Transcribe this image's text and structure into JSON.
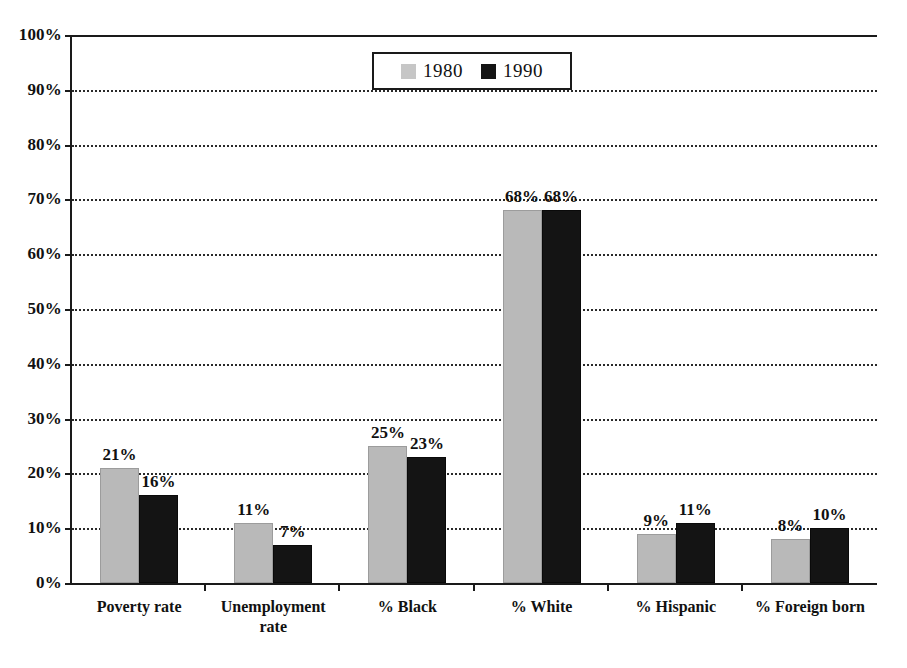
{
  "chart_data": {
    "type": "bar",
    "title": "",
    "subtitle": "",
    "xlabel": "",
    "ylabel": "",
    "grid": true,
    "legend_position": "top-center",
    "ylim": [
      0,
      100
    ],
    "ytick_labels": [
      "100%",
      "90%",
      "80%",
      "70%",
      "60%",
      "50%",
      "40%",
      "30%",
      "20%",
      "10%",
      "0%"
    ],
    "ytick_values": [
      100,
      90,
      80,
      70,
      60,
      50,
      40,
      30,
      20,
      10,
      0
    ],
    "categories": [
      "Poverty rate",
      "Unemployment\nrate",
      "% Black",
      "% White",
      "% Hispanic",
      "% Foreign born"
    ],
    "series": [
      {
        "name": "1980",
        "color": "#b9b9b9",
        "values": [
          21,
          11,
          25,
          68,
          9,
          8
        ],
        "labels": [
          "21%",
          "11%",
          "25%",
          "68%",
          "9%",
          "8%"
        ]
      },
      {
        "name": "1990",
        "color": "#141414",
        "values": [
          16,
          7,
          23,
          68,
          11,
          10
        ],
        "labels": [
          "16%",
          "7%",
          "23%",
          "68%",
          "11%",
          "10%"
        ]
      }
    ]
  },
  "legend": {
    "items": [
      {
        "label": "1980",
        "swatch": "legend-swatch-1980"
      },
      {
        "label": "1990",
        "swatch": "legend-swatch-1990"
      }
    ]
  }
}
